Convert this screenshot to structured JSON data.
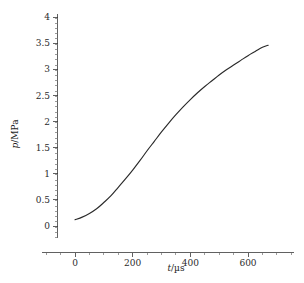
{
  "chart_data": {
    "type": "line",
    "title": "",
    "subtitle": "",
    "xlabel": "t/µs",
    "ylabel": "p/MPa",
    "xlabel_symbol": "t",
    "xlabel_unit": "µs",
    "ylabel_symbol": "p",
    "ylabel_unit": "MPa",
    "grid": false,
    "legend": false,
    "legend_position": "none",
    "xlim": [
      -110,
      760
    ],
    "ylim": [
      -0.22,
      4.08
    ],
    "x_major_ticks": [
      0,
      200,
      400,
      600
    ],
    "x_major_tick_labels": [
      "0",
      "200",
      "400",
      "600"
    ],
    "x_minor_tick_interval": 50,
    "y_major_ticks": [
      0,
      0.5,
      1,
      1.5,
      2,
      2.5,
      3,
      3.5,
      4
    ],
    "y_major_tick_labels": [
      "0",
      "0.5",
      "1",
      "1.5",
      "2",
      "2.5",
      "3",
      "3.5",
      "4"
    ],
    "y_minor_tick_interval": 0.1,
    "line_color": "#2a2a2a",
    "axis_color": "#3a3a3a",
    "background_color": "#ffffff",
    "series": [
      {
        "name": "pressure",
        "x": [
          0,
          25,
          50,
          75,
          100,
          125,
          150,
          175,
          200,
          225,
          250,
          275,
          300,
          325,
          350,
          375,
          400,
          425,
          450,
          475,
          500,
          525,
          550,
          575,
          600,
          625,
          650,
          670
        ],
        "y": [
          0.12,
          0.17,
          0.24,
          0.33,
          0.45,
          0.58,
          0.74,
          0.9,
          1.07,
          1.25,
          1.44,
          1.62,
          1.8,
          1.97,
          2.13,
          2.28,
          2.42,
          2.55,
          2.67,
          2.78,
          2.89,
          2.99,
          3.08,
          3.17,
          3.26,
          3.34,
          3.42,
          3.46
        ]
      }
    ],
    "annotations": []
  }
}
